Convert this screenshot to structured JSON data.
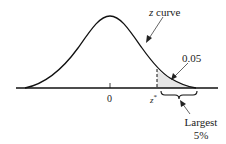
{
  "diagram": {
    "curve_label_var": "z",
    "curve_label_word": " curve",
    "area_label": "0.05",
    "zero_label": "0",
    "critical_label_base": "z",
    "critical_label_sup": "*",
    "brace_label_line1": "Largest",
    "brace_label_line2": "5%",
    "colors": {
      "line": "#111111",
      "shade": "#e6e6e6",
      "text": "#222222",
      "background": "#ffffff"
    }
  }
}
